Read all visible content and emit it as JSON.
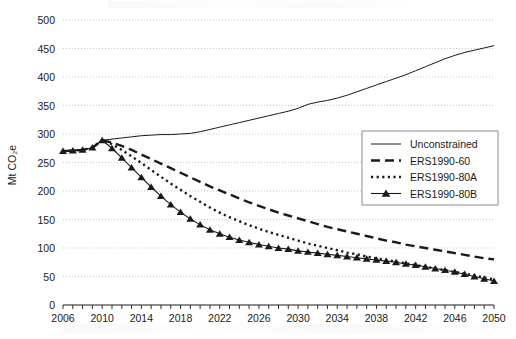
{
  "chart_data": {
    "type": "line",
    "title": "",
    "xlabel": "",
    "ylabel": "Mt CO2e",
    "ylabel_display": "Mt CO₂e",
    "xlim": [
      2006,
      2050
    ],
    "ylim": [
      0,
      500
    ],
    "ytick_step": 50,
    "yticks": [
      0,
      50,
      100,
      150,
      200,
      250,
      300,
      350,
      400,
      450,
      500
    ],
    "xticks": [
      2006,
      2010,
      2014,
      2018,
      2022,
      2026,
      2030,
      2034,
      2038,
      2042,
      2046,
      2050
    ],
    "xtick_minor_step": 1,
    "grid": "horizontal-dotted",
    "legend_position": "upper-right",
    "x": [
      2006,
      2007,
      2008,
      2009,
      2010,
      2011,
      2012,
      2013,
      2014,
      2015,
      2016,
      2017,
      2018,
      2019,
      2020,
      2021,
      2022,
      2023,
      2024,
      2025,
      2026,
      2027,
      2028,
      2029,
      2030,
      2031,
      2032,
      2033,
      2034,
      2035,
      2036,
      2037,
      2038,
      2039,
      2040,
      2041,
      2042,
      2043,
      2044,
      2045,
      2046,
      2047,
      2048,
      2049,
      2050
    ],
    "series": [
      {
        "name": "Unconstrained",
        "style": "solid-thin",
        "values": [
          270,
          271,
          272,
          276,
          289,
          291,
          293,
          295,
          297,
          298,
          299,
          299,
          300,
          301,
          304,
          308,
          312,
          316,
          320,
          324,
          328,
          332,
          336,
          340,
          345,
          352,
          356,
          359,
          363,
          368,
          374,
          380,
          386,
          392,
          398,
          404,
          411,
          418,
          425,
          432,
          438,
          443,
          447,
          451,
          455
        ]
      },
      {
        "name": "ERS1990-60",
        "style": "thick-dashed",
        "values": [
          270,
          271,
          272,
          276,
          289,
          285,
          279,
          272,
          264,
          256,
          248,
          240,
          232,
          224,
          216,
          208,
          201,
          194,
          187,
          180,
          174,
          168,
          162,
          157,
          152,
          147,
          142,
          137,
          133,
          129,
          125,
          121,
          117,
          113,
          110,
          106,
          103,
          100,
          97,
          94,
          91,
          88,
          85,
          82,
          80
        ]
      },
      {
        "name": "ERS1990-80A",
        "style": "thick-dotted",
        "values": [
          270,
          271,
          272,
          276,
          289,
          282,
          272,
          261,
          249,
          237,
          225,
          213,
          202,
          191,
          181,
          171,
          162,
          154,
          147,
          140,
          134,
          128,
          123,
          118,
          113,
          108,
          104,
          100,
          96,
          92,
          89,
          85,
          82,
          79,
          76,
          73,
          70,
          67,
          64,
          61,
          58,
          55,
          52,
          48,
          45
        ]
      },
      {
        "name": "ERS1990-80B",
        "style": "solid-marker-triangle",
        "values": [
          270,
          271,
          272,
          276,
          289,
          275,
          258,
          241,
          224,
          207,
          191,
          176,
          163,
          151,
          141,
          132,
          125,
          119,
          114,
          110,
          106,
          103,
          100,
          98,
          95,
          93,
          91,
          89,
          87,
          85,
          83,
          81,
          79,
          77,
          75,
          72,
          70,
          67,
          64,
          61,
          58,
          54,
          50,
          46,
          42
        ]
      }
    ]
  },
  "legend": {
    "items": [
      {
        "label": "Unconstrained"
      },
      {
        "label": "ERS1990-60"
      },
      {
        "label": "ERS1990-80A"
      },
      {
        "label": "ERS1990-80B"
      }
    ]
  },
  "colors": {
    "line": "#1a1a1a",
    "grid": "#b9b9b9",
    "axis": "#1a1a1a",
    "legend_border": "#8c8c8c",
    "background": "#ffffff"
  }
}
